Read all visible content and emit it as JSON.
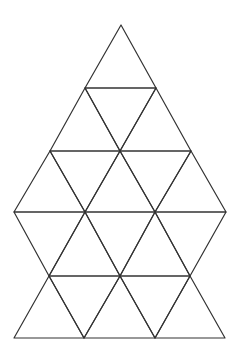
{
  "diagram": {
    "title": "Triangular grid figure",
    "stroke_color": "#333333",
    "background_color": "#ffffff",
    "vertex_rows": [
      {
        "y": 25,
        "x": [
          121
        ]
      },
      {
        "y": 88,
        "x": [
          85,
          156
        ]
      },
      {
        "y": 151,
        "x": [
          50,
          120,
          191
        ]
      },
      {
        "y": 212,
        "x": [
          14,
          85,
          155,
          226
        ]
      },
      {
        "y": 276,
        "x": [
          49,
          120,
          190
        ]
      },
      {
        "y": 338,
        "x": [
          14,
          84,
          155,
          225
        ]
      }
    ],
    "triangles": [
      {
        "id": "t1",
        "points": [
          [
            121,
            25
          ],
          [
            85,
            88
          ],
          [
            156,
            88
          ]
        ]
      },
      {
        "id": "t2",
        "points": [
          [
            85,
            88
          ],
          [
            50,
            151
          ],
          [
            120,
            151
          ]
        ]
      },
      {
        "id": "t3",
        "points": [
          [
            85,
            88
          ],
          [
            156,
            88
          ],
          [
            120,
            151
          ]
        ]
      },
      {
        "id": "t4",
        "points": [
          [
            156,
            88
          ],
          [
            120,
            151
          ],
          [
            191,
            151
          ]
        ]
      },
      {
        "id": "t5",
        "points": [
          [
            50,
            151
          ],
          [
            14,
            212
          ],
          [
            85,
            212
          ]
        ]
      },
      {
        "id": "t6",
        "points": [
          [
            50,
            151
          ],
          [
            120,
            151
          ],
          [
            85,
            212
          ]
        ]
      },
      {
        "id": "t7",
        "points": [
          [
            120,
            151
          ],
          [
            85,
            212
          ],
          [
            155,
            212
          ]
        ]
      },
      {
        "id": "t8",
        "points": [
          [
            120,
            151
          ],
          [
            191,
            151
          ],
          [
            155,
            212
          ]
        ]
      },
      {
        "id": "t9",
        "points": [
          [
            191,
            151
          ],
          [
            155,
            212
          ],
          [
            226,
            212
          ]
        ]
      },
      {
        "id": "t10",
        "points": [
          [
            14,
            212
          ],
          [
            85,
            212
          ],
          [
            49,
            276
          ]
        ]
      },
      {
        "id": "t11",
        "points": [
          [
            85,
            212
          ],
          [
            49,
            276
          ],
          [
            120,
            276
          ]
        ]
      },
      {
        "id": "t12",
        "points": [
          [
            85,
            212
          ],
          [
            155,
            212
          ],
          [
            120,
            276
          ]
        ]
      },
      {
        "id": "t13",
        "points": [
          [
            155,
            212
          ],
          [
            120,
            276
          ],
          [
            190,
            276
          ]
        ]
      },
      {
        "id": "t14",
        "points": [
          [
            155,
            212
          ],
          [
            226,
            212
          ],
          [
            190,
            276
          ]
        ]
      },
      {
        "id": "t15",
        "points": [
          [
            49,
            276
          ],
          [
            14,
            338
          ],
          [
            84,
            338
          ]
        ]
      },
      {
        "id": "t16",
        "points": [
          [
            49,
            276
          ],
          [
            120,
            276
          ],
          [
            84,
            338
          ]
        ]
      },
      {
        "id": "t17",
        "points": [
          [
            120,
            276
          ],
          [
            84,
            338
          ],
          [
            155,
            338
          ]
        ]
      },
      {
        "id": "t18",
        "points": [
          [
            120,
            276
          ],
          [
            190,
            276
          ],
          [
            155,
            338
          ]
        ]
      },
      {
        "id": "t19",
        "points": [
          [
            190,
            276
          ],
          [
            155,
            338
          ],
          [
            225,
            338
          ]
        ]
      }
    ],
    "triangle_count": 19
  }
}
